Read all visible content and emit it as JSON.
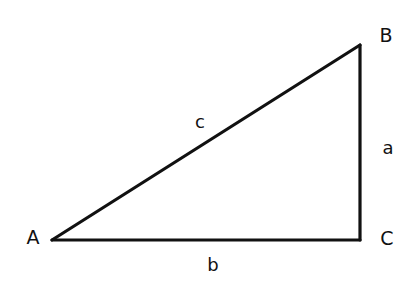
{
  "diagram": {
    "type": "right-triangle",
    "vertices": [
      {
        "id": "A",
        "label": "A",
        "x": 52,
        "y": 240,
        "label_x": 33,
        "label_y": 237
      },
      {
        "id": "B",
        "label": "B",
        "x": 360,
        "y": 45,
        "label_x": 386,
        "label_y": 35
      },
      {
        "id": "C",
        "label": "C",
        "x": 360,
        "y": 240,
        "label_x": 387,
        "label_y": 238
      }
    ],
    "sides": [
      {
        "id": "a",
        "label": "a",
        "from": "B",
        "to": "C",
        "label_x": 388,
        "label_y": 148
      },
      {
        "id": "b",
        "label": "b",
        "from": "A",
        "to": "C",
        "label_x": 213,
        "label_y": 265
      },
      {
        "id": "c",
        "label": "c",
        "from": "A",
        "to": "B",
        "label_x": 200,
        "label_y": 122
      }
    ],
    "right_angle_at": "C",
    "stroke_color": "#111111",
    "background_color": "#ffffff"
  }
}
